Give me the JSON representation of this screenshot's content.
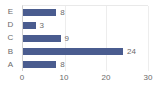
{
  "chart_data": {
    "type": "bar",
    "orientation": "horizontal",
    "title": "",
    "subtitle": "",
    "xlabel": "",
    "ylabel": "",
    "categories": [
      "E",
      "D",
      "C",
      "B",
      "A"
    ],
    "values": [
      8,
      3,
      9,
      24,
      8
    ],
    "data_labels": [
      "8",
      "3",
      "9",
      "24",
      "8"
    ],
    "show_data_labels": true,
    "xlim": [
      0,
      30
    ],
    "xticks": [
      0,
      10,
      20,
      30
    ],
    "xtick_labels": [
      "0",
      "10",
      "20",
      "30"
    ],
    "grid": {
      "vertical": true,
      "horizontal": false
    },
    "legend": {
      "visible": false,
      "position": "none"
    },
    "colors": {
      "bar": "#4a5c8f",
      "text": "#6a6a6a",
      "gridline": "#ededed",
      "axis_line": "#d0d0d0",
      "plot_border": "#e9e9e9",
      "background": "#ffffff"
    }
  }
}
